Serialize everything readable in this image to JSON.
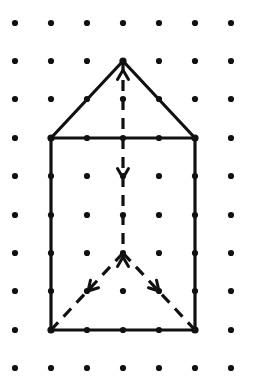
{
  "figure": {
    "background_color": "#ffffff",
    "ink_color": "#111111",
    "canvas": {
      "width": 273,
      "height": 384
    }
  },
  "grid": {
    "name": "dot-lattice",
    "columns": 7,
    "rows": 10,
    "x_spacing": 36,
    "y_spacing": 38.3,
    "x_origin": 15,
    "y_origin": 23,
    "dot_radius": 3.1,
    "dot_color": "#111111",
    "col_positions": [
      15,
      51,
      87,
      123,
      159,
      195,
      231
    ],
    "row_positions": [
      23,
      61,
      99,
      138,
      176,
      215,
      253,
      291,
      330,
      368
    ]
  },
  "shape": {
    "name": "house-polygon",
    "label": "pentagon house outline",
    "vertices": [
      {
        "name": "roof-apex",
        "col": 3,
        "row": 1,
        "x": 123,
        "y": 61
      },
      {
        "name": "roof-right-eave",
        "col": 5,
        "row": 3,
        "x": 195,
        "y": 138
      },
      {
        "name": "base-right",
        "col": 5,
        "row": 8,
        "x": 195,
        "y": 330
      },
      {
        "name": "base-left",
        "col": 1,
        "row": 8,
        "x": 51,
        "y": 330
      },
      {
        "name": "roof-left-eave",
        "col": 1,
        "row": 3,
        "x": 51,
        "y": 138
      }
    ],
    "solid_edges": [
      {
        "name": "roof-left-slope",
        "from": [
          123,
          61
        ],
        "to": [
          51,
          138
        ]
      },
      {
        "name": "roof-right-slope",
        "from": [
          123,
          61
        ],
        "to": [
          195,
          138
        ]
      },
      {
        "name": "eave-line",
        "from": [
          51,
          138
        ],
        "to": [
          195,
          138
        ]
      },
      {
        "name": "wall-left",
        "from": [
          51,
          138
        ],
        "to": [
          51,
          330
        ]
      },
      {
        "name": "wall-right",
        "from": [
          195,
          138
        ],
        "to": [
          195,
          330
        ]
      },
      {
        "name": "base-line",
        "from": [
          51,
          330
        ],
        "to": [
          195,
          330
        ]
      }
    ]
  },
  "construction": {
    "name": "dashed-construction-lines",
    "dash_pattern": "11 8",
    "lines": [
      {
        "name": "vertical-axis-upper",
        "from": [
          123,
          61
        ],
        "to": [
          123,
          138
        ],
        "style": "dashed"
      },
      {
        "name": "vertical-axis-lower",
        "from": [
          123,
          138
        ],
        "to": [
          123,
          253
        ],
        "style": "dashed"
      },
      {
        "name": "diagonal-down-left",
        "from": [
          123,
          253
        ],
        "to": [
          51,
          330
        ],
        "style": "dashed"
      },
      {
        "name": "diagonal-down-right",
        "from": [
          123,
          253
        ],
        "to": [
          195,
          330
        ],
        "style": "dashed"
      }
    ],
    "arrowheads": [
      {
        "name": "arrow-up-at-apex",
        "x": 123,
        "y": 70,
        "direction": "up"
      },
      {
        "name": "arrow-down-midaxis",
        "x": 123,
        "y": 178,
        "direction": "down"
      },
      {
        "name": "arrow-up-at-v-apex",
        "x": 123,
        "y": 257,
        "direction": "up"
      },
      {
        "name": "arrow-down-left-diagonal",
        "x": 88,
        "y": 291,
        "direction": "down-left"
      },
      {
        "name": "arrow-down-right-diagonal",
        "x": 159,
        "y": 291,
        "direction": "down-right"
      }
    ]
  },
  "chart_data": {
    "type": "scatter",
    "xlabel": "",
    "ylabel": "",
    "grid": true,
    "legend": "none",
    "xlim": [
      0,
      6
    ],
    "ylim": [
      0,
      9
    ],
    "x": [
      0,
      1,
      2,
      3,
      4,
      5,
      6
    ],
    "y": [
      0,
      1,
      2,
      3,
      4,
      5,
      6,
      7,
      8,
      9
    ],
    "categories": [
      "lattice point"
    ],
    "values": [
      70
    ],
    "annotations": [
      "house polygon vertices at (3,1) apex, (1,3) and (5,3) eaves, (1,8) and (5,8) base",
      "dashed vertical symmetry axis from (3,1) to (3,6)",
      "dashed diagonals from (3,6) to (1,8) and (3,6) to (5,8)"
    ]
  }
}
